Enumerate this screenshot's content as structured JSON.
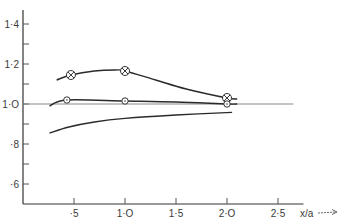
{
  "chart_data": {
    "type": "line",
    "title": "",
    "xlabel": "x/a",
    "ylabel": "",
    "xlim": [
      0,
      2.75
    ],
    "ylim": [
      0.5,
      1.5
    ],
    "x_ticks": [
      0.5,
      1.0,
      1.5,
      2.0,
      2.5
    ],
    "x_tick_labels": [
      "·5",
      "1·O",
      "1·5",
      "2·O",
      "2·5"
    ],
    "y_ticks": [
      0.6,
      0.7,
      0.8,
      0.9,
      1.0,
      1.1,
      1.2,
      1.3,
      1.4
    ],
    "y_tick_labels": {
      "0.6": "·6",
      "0.8": "·8",
      "1.0": "1·O",
      "1.2": "1·2",
      "1.4": "1·4"
    },
    "reference_line": {
      "y": 1.0,
      "x_end": 2.65
    },
    "grid": false,
    "legend": "none",
    "series": [
      {
        "name": "crossed-circle series",
        "marker": "crossed-circle",
        "curve": [
          [
            0.33,
            1.12
          ],
          [
            0.47,
            1.145
          ],
          [
            0.7,
            1.165
          ],
          [
            0.9,
            1.17
          ],
          [
            1.0,
            1.165
          ],
          [
            1.3,
            1.12
          ],
          [
            1.6,
            1.075
          ],
          [
            2.0,
            1.03
          ],
          [
            2.1,
            1.025
          ]
        ],
        "points": [
          [
            0.47,
            1.145
          ],
          [
            1.0,
            1.165
          ],
          [
            2.0,
            1.03
          ]
        ]
      },
      {
        "name": "open-circle series",
        "marker": "open-circle",
        "curve": [
          [
            0.26,
            0.99
          ],
          [
            0.43,
            1.02
          ],
          [
            1.0,
            1.015
          ],
          [
            1.5,
            1.01
          ],
          [
            2.0,
            1.0
          ],
          [
            2.1,
            1.0
          ]
        ],
        "points": [
          [
            0.43,
            1.02
          ],
          [
            1.0,
            1.015
          ],
          [
            2.0,
            1.0
          ]
        ]
      },
      {
        "name": "lower curve",
        "marker": "none",
        "curve": [
          [
            0.26,
            0.855
          ],
          [
            0.45,
            0.885
          ],
          [
            0.7,
            0.91
          ],
          [
            1.0,
            0.928
          ],
          [
            1.5,
            0.945
          ],
          [
            2.05,
            0.958
          ]
        ],
        "points": []
      }
    ]
  }
}
